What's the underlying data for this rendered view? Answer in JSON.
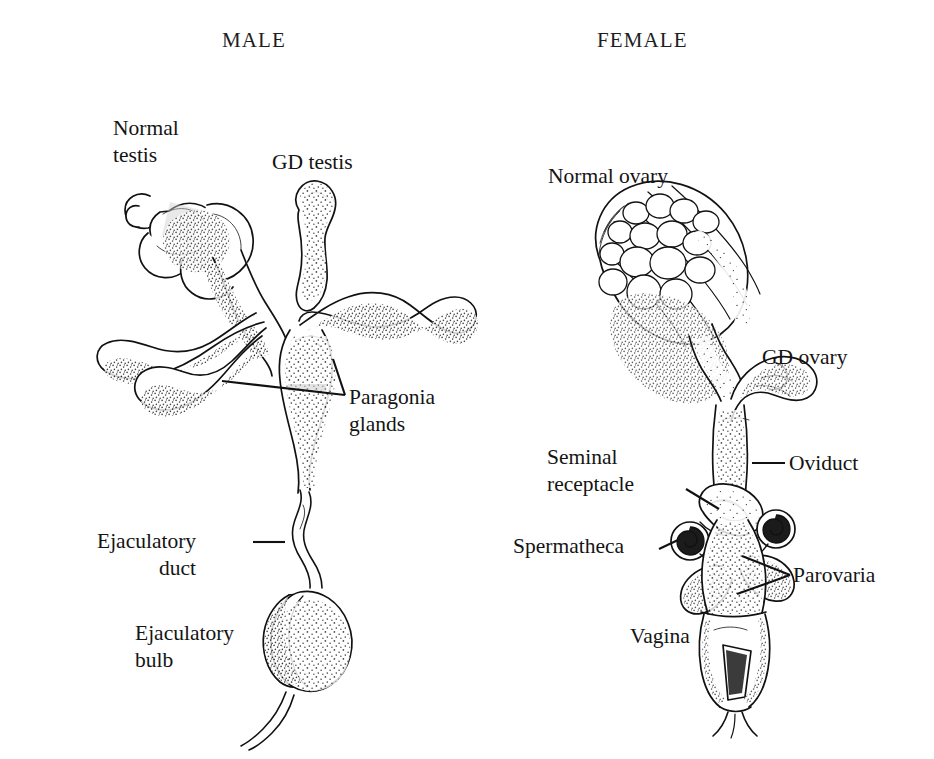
{
  "figure": {
    "kind": "scientific-line-illustration",
    "style": "black-and-white stippled pen-and-ink drawing",
    "background_color": "#ffffff",
    "ink_color": "#111111"
  },
  "panels": {
    "male": {
      "title": "MALE",
      "labels": [
        {
          "id": "normal-testis",
          "text_lines": [
            "Normal",
            "testis"
          ],
          "leader": "none"
        },
        {
          "id": "gd-testis",
          "text_lines": [
            "GD testis"
          ],
          "leader": "none"
        },
        {
          "id": "paragonia",
          "text_lines": [
            "Paragonia",
            "glands"
          ],
          "leader": "fork-left"
        },
        {
          "id": "ejaculatory-duct",
          "text_lines": [
            "Ejaculatory",
            "duct"
          ],
          "leader": "dash-right"
        },
        {
          "id": "ejaculatory-bulb",
          "text_lines": [
            "Ejaculatory",
            "bulb"
          ],
          "leader": "none"
        }
      ]
    },
    "female": {
      "title": "FEMALE",
      "labels": [
        {
          "id": "normal-ovary",
          "text_lines": [
            "Normal ovary"
          ],
          "leader": "none"
        },
        {
          "id": "gd-ovary",
          "text_lines": [
            "GD ovary"
          ],
          "leader": "none"
        },
        {
          "id": "oviduct",
          "text_lines": [
            "Oviduct"
          ],
          "leader": "dash-left"
        },
        {
          "id": "seminal-receptacle",
          "text_lines": [
            "Seminal",
            "receptacle"
          ],
          "leader": "diagonal-right"
        },
        {
          "id": "spermatheca",
          "text_lines": [
            "Spermatheca"
          ],
          "leader": "diagonal-right"
        },
        {
          "id": "parovaria",
          "text_lines": [
            "Parovaria"
          ],
          "leader": "fork-left"
        },
        {
          "id": "vagina",
          "text_lines": [
            "Vagina"
          ],
          "leader": "none"
        }
      ]
    }
  },
  "text": {
    "male_title": "MALE",
    "female_title": "FEMALE",
    "normal_testis_1": "Normal",
    "normal_testis_2": "testis",
    "gd_testis": "GD testis",
    "paragonia_1": "Paragonia",
    "paragonia_2": "glands",
    "ejaculatory_duct_1": "Ejaculatory",
    "ejaculatory_duct_2": "duct",
    "ejaculatory_bulb_1": "Ejaculatory",
    "ejaculatory_bulb_2": "bulb",
    "normal_ovary": "Normal ovary",
    "gd_ovary": "GD ovary",
    "oviduct": "Oviduct",
    "seminal_receptacle_1": "Seminal",
    "seminal_receptacle_2": "receptacle",
    "spermatheca": "Spermatheca",
    "parovaria": "Parovaria",
    "vagina": "Vagina"
  }
}
